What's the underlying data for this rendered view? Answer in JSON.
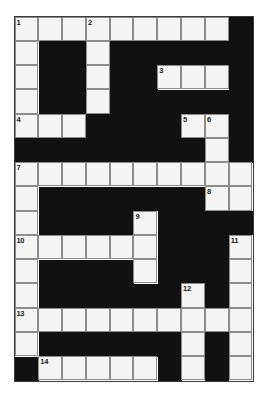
{
  "puzzle": {
    "title": "Crossword Grid",
    "type": "crossword",
    "columns": 10,
    "rows": 15,
    "colors": {
      "block": "#111111",
      "cell": "#f4f4f2",
      "grid_line": "#8c8c8c",
      "frame": "#3a3a3a",
      "page_background": "#ffffff",
      "number_text": "#1a1a1a"
    },
    "legend": {
      "white_cell": "letter-cell",
      "black_cell": "block-cell"
    },
    "clue_numbers": [
      "1",
      "2",
      "3",
      "4",
      "5",
      "6",
      "7",
      "8",
      "9",
      "10",
      "11",
      "12",
      "13",
      "14"
    ],
    "grid": [
      [
        "W",
        "W",
        "W",
        "W",
        "W",
        "W",
        "W",
        "W",
        "W",
        "B"
      ],
      [
        "W",
        "B",
        "B",
        "W",
        "B",
        "B",
        "B",
        "B",
        "B",
        "B"
      ],
      [
        "W",
        "B",
        "B",
        "W",
        "B",
        "B",
        "W",
        "W",
        "W",
        "B"
      ],
      [
        "W",
        "B",
        "B",
        "W",
        "B",
        "B",
        "B",
        "B",
        "B",
        "B"
      ],
      [
        "W",
        "W",
        "W",
        "B",
        "B",
        "B",
        "B",
        "W",
        "W",
        "B"
      ],
      [
        "B",
        "B",
        "B",
        "B",
        "B",
        "B",
        "B",
        "B",
        "W",
        "B"
      ],
      [
        "W",
        "W",
        "W",
        "W",
        "W",
        "W",
        "W",
        "W",
        "W",
        "W"
      ],
      [
        "W",
        "B",
        "B",
        "B",
        "B",
        "B",
        "B",
        "B",
        "W",
        "W"
      ],
      [
        "W",
        "B",
        "B",
        "B",
        "B",
        "W",
        "B",
        "B",
        "B",
        "B"
      ],
      [
        "W",
        "W",
        "W",
        "W",
        "W",
        "W",
        "B",
        "B",
        "B",
        "W"
      ],
      [
        "W",
        "B",
        "B",
        "B",
        "B",
        "W",
        "B",
        "B",
        "B",
        "W"
      ],
      [
        "W",
        "B",
        "B",
        "B",
        "B",
        "B",
        "B",
        "W",
        "B",
        "W"
      ],
      [
        "W",
        "W",
        "W",
        "W",
        "W",
        "W",
        "W",
        "W",
        "W",
        "W"
      ],
      [
        "W",
        "B",
        "B",
        "B",
        "B",
        "B",
        "B",
        "W",
        "B",
        "W"
      ],
      [
        "B",
        "W",
        "W",
        "W",
        "W",
        "W",
        "B",
        "W",
        "B",
        "W"
      ]
    ],
    "numbers": [
      {
        "row": 0,
        "col": 0,
        "label": "1"
      },
      {
        "row": 0,
        "col": 3,
        "label": "2"
      },
      {
        "row": 2,
        "col": 6,
        "label": "3"
      },
      {
        "row": 4,
        "col": 0,
        "label": "4"
      },
      {
        "row": 4,
        "col": 7,
        "label": "5"
      },
      {
        "row": 4,
        "col": 8,
        "label": "6"
      },
      {
        "row": 6,
        "col": 0,
        "label": "7"
      },
      {
        "row": 7,
        "col": 8,
        "label": "8"
      },
      {
        "row": 8,
        "col": 5,
        "label": "9"
      },
      {
        "row": 9,
        "col": 0,
        "label": "10"
      },
      {
        "row": 9,
        "col": 9,
        "label": "11"
      },
      {
        "row": 11,
        "col": 7,
        "label": "12"
      },
      {
        "row": 12,
        "col": 0,
        "label": "13"
      },
      {
        "row": 14,
        "col": 1,
        "label": "14"
      }
    ]
  }
}
